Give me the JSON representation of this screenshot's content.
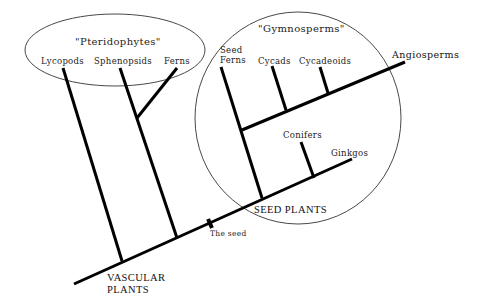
{
  "groups": {
    "pteridophytes": "\"Pteridophytes\"",
    "gymnosperms": "\"Gymnosperms\""
  },
  "taxa": {
    "lycopods": "Lycopods",
    "sphenopsids": "Sphenopsids",
    "ferns": "Ferns",
    "seed_ferns_1": "Seed",
    "seed_ferns_2": "Ferns",
    "cycads": "Cycads",
    "cycadeoids": "Cycadeoids",
    "conifers": "Conifers",
    "ginkgos": "Ginkgos",
    "angiosperms": "Angiosperms"
  },
  "nodes": {
    "vascular_plants_1": "VASCULAR",
    "vascular_plants_2": "PLANTS",
    "seed_plants": "SEED PLANTS",
    "the_seed": "The seed"
  },
  "colors": {
    "line": "#000000",
    "ellipse": "#333333",
    "background": "#ffffff"
  }
}
